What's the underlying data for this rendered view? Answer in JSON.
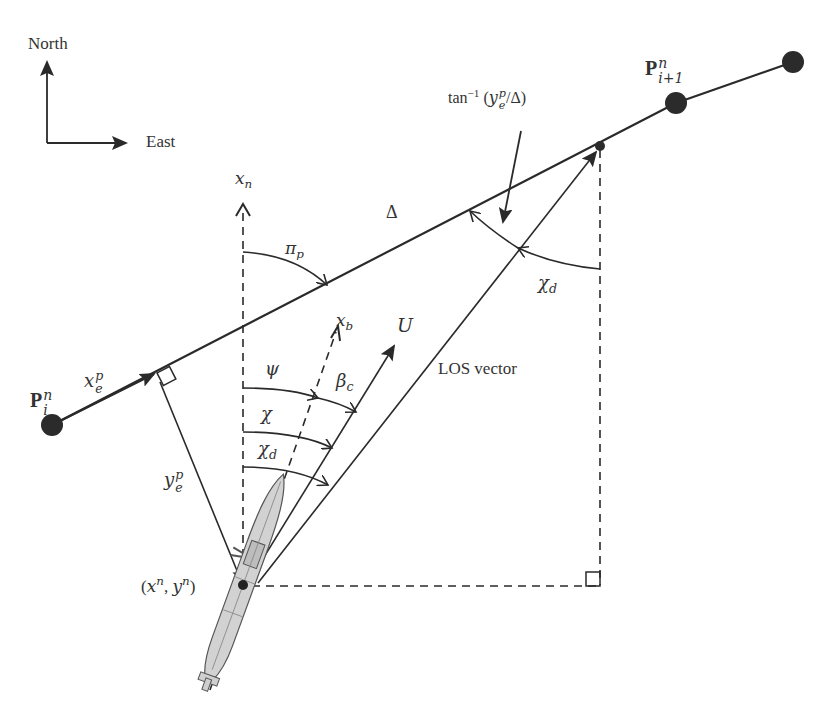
{
  "compass": {
    "north_label": "North",
    "east_label": "East"
  },
  "waypoints": {
    "p_i": {
      "base": "P",
      "sup": "n",
      "sub": "i"
    },
    "p_i1": {
      "base": "P",
      "sup": "n",
      "sub": "i+1"
    }
  },
  "labels": {
    "x_n": {
      "base": "x",
      "sub": "n"
    },
    "x_b": {
      "base": "x",
      "sub": "b"
    },
    "u": "U",
    "delta": "Δ",
    "pi_p": {
      "base": "π",
      "sub": "p"
    },
    "x_e_p": {
      "base": "x",
      "sup": "p",
      "sub": "e"
    },
    "y_e_p": {
      "base": "y",
      "sup": "p",
      "sub": "e"
    },
    "psi": "ψ",
    "beta_c": {
      "base": "β",
      "sub": "c"
    },
    "chi": "χ",
    "chi_d_lower": {
      "base": "χ",
      "sub": "d"
    },
    "chi_d_right": {
      "base": "χ",
      "sub": "d"
    },
    "los_vector": "LOS vector",
    "position": {
      "open": "(",
      "x": "x",
      "x_sup": "n",
      "sep": ", ",
      "y": "y",
      "y_sup": "n",
      "close": ")"
    },
    "tan_expr": {
      "fn": "tan",
      "fn_sup": "−1",
      "open": " (",
      "y": "y",
      "y_sup": "p",
      "y_sub": "e",
      "rest": "/Δ)"
    }
  },
  "colors": {
    "line": "#2a2a2a",
    "waypoint": "#2b2b2b",
    "vessel_fill": "#cfcfcf",
    "vessel_stroke": "#555555",
    "text": "#333333"
  }
}
